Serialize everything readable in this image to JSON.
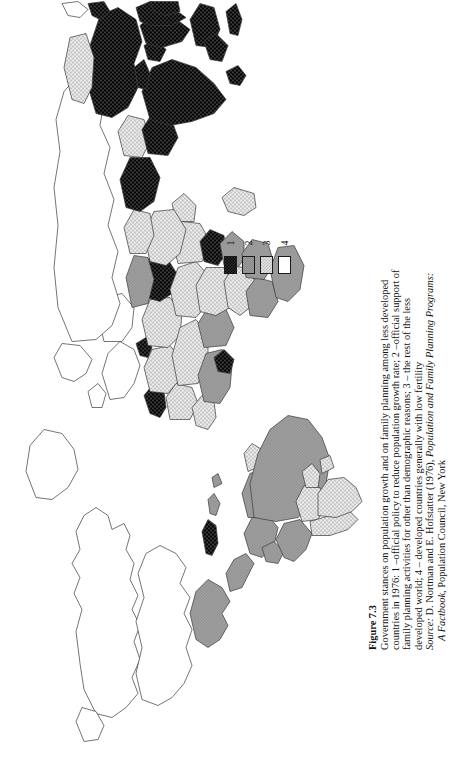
{
  "figure": {
    "number": "Figure 7.3",
    "caption_lines": [
      "Government stances on population growth and on family planning among less developed",
      "countries in 1976: 1 –official policy to reduce population growth rate; 2 –official support of",
      "family planning activities for other than demographic reasons; 3 – the rest of the less",
      "developed world; 4 – developed countries generally with low fertility"
    ],
    "source_label": "Source:",
    "source_line_1_rest": " D. Nortman and E. Hofstatter (1976), ",
    "source_title_1": "Population and Family Planning Programs:",
    "source_title_2": "A Factbook",
    "source_line_2_rest": ", Population Council, New York"
  },
  "legend": {
    "title": "",
    "items": [
      {
        "label": "1",
        "pattern": "dense-dark-crosshatch",
        "color": "#2c2c2c"
      },
      {
        "label": "2",
        "pattern": "mid-grey-stipple",
        "color": "#9c9c9c"
      },
      {
        "label": "3",
        "pattern": "light-grey-crosshatch",
        "color": "#e2e2e2"
      },
      {
        "label": "4",
        "pattern": "white-blank",
        "color": "#ffffff"
      }
    ]
  },
  "map": {
    "type": "choropleth-world",
    "projection_note": "world map printed rotated 90 degrees on the page",
    "outline_color": "#3a3a3a",
    "background": "#ffffff",
    "categories": {
      "1": "official policy to reduce population growth rate",
      "2": "official support of family planning activities for other than demographic reasons",
      "3": "the rest of the less developed world",
      "4": "developed countries generally with low fertility"
    },
    "regions": [
      {
        "name": "canada",
        "category": 4
      },
      {
        "name": "united-states",
        "category": 4
      },
      {
        "name": "greenland",
        "category": 4
      },
      {
        "name": "mexico",
        "category": 2
      },
      {
        "name": "central-america",
        "category": 2
      },
      {
        "name": "cuba",
        "category": 1
      },
      {
        "name": "caribbean",
        "category": 2
      },
      {
        "name": "colombia",
        "category": 2
      },
      {
        "name": "venezuela",
        "category": 2
      },
      {
        "name": "brazil",
        "category": 2
      },
      {
        "name": "peru",
        "category": 2
      },
      {
        "name": "chile",
        "category": 2
      },
      {
        "name": "argentina",
        "category": 3
      },
      {
        "name": "bolivia",
        "category": 3
      },
      {
        "name": "paraguay",
        "category": 3
      },
      {
        "name": "uruguay",
        "category": 3
      },
      {
        "name": "western-europe",
        "category": 4
      },
      {
        "name": "eastern-europe",
        "category": 4
      },
      {
        "name": "soviet-union",
        "category": 4
      },
      {
        "name": "north-africa",
        "category": 3
      },
      {
        "name": "egypt",
        "category": 1
      },
      {
        "name": "tunisia",
        "category": 1
      },
      {
        "name": "morocco",
        "category": 1
      },
      {
        "name": "algeria",
        "category": 3
      },
      {
        "name": "libya",
        "category": 3
      },
      {
        "name": "sahel",
        "category": 3
      },
      {
        "name": "west-africa",
        "category": 2
      },
      {
        "name": "ghana",
        "category": 1
      },
      {
        "name": "nigeria",
        "category": 2
      },
      {
        "name": "kenya",
        "category": 1
      },
      {
        "name": "ethiopia",
        "category": 3
      },
      {
        "name": "southern-africa",
        "category": 2
      },
      {
        "name": "turkey",
        "category": 2
      },
      {
        "name": "middle-east",
        "category": 3
      },
      {
        "name": "iran",
        "category": 1
      },
      {
        "name": "india",
        "category": 1
      },
      {
        "name": "pakistan",
        "category": 1
      },
      {
        "name": "bangladesh",
        "category": 1
      },
      {
        "name": "nepal",
        "category": 1
      },
      {
        "name": "sri-lanka",
        "category": 1
      },
      {
        "name": "china",
        "category": 1
      },
      {
        "name": "mongolia",
        "category": 3
      },
      {
        "name": "japan",
        "category": 4
      },
      {
        "name": "korea",
        "category": 1
      },
      {
        "name": "taiwan",
        "category": 1
      },
      {
        "name": "vietnam",
        "category": 1
      },
      {
        "name": "thailand",
        "category": 1
      },
      {
        "name": "malaysia",
        "category": 1
      },
      {
        "name": "indonesia",
        "category": 1
      },
      {
        "name": "philippines",
        "category": 1
      },
      {
        "name": "australia",
        "category": 4
      },
      {
        "name": "new-zealand",
        "category": 4
      },
      {
        "name": "papua-new-guinea",
        "category": 3
      }
    ]
  }
}
